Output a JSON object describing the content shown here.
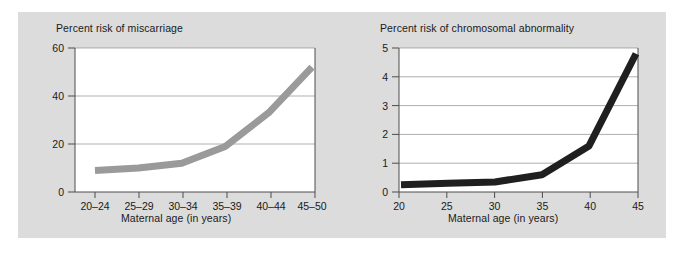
{
  "figure": {
    "background_color": "#dcdcdc",
    "canvas_color": "#ffffff"
  },
  "chart_data": [
    {
      "id": "miscarriage",
      "type": "line",
      "title": "Percent risk of miscarriage",
      "xlabel": "Maternal age (in years)",
      "ylabel": "",
      "categories": [
        "20–24",
        "25–29",
        "30–34",
        "35–39",
        "40–44",
        "45–50"
      ],
      "values": [
        9,
        10,
        12,
        19,
        33,
        52
      ],
      "yticks": [
        0,
        20,
        40,
        60
      ],
      "ylim": [
        0,
        60
      ],
      "grid": "horizontal",
      "legend": "none",
      "series_color": "#9a9a9a",
      "line_width": 7
    },
    {
      "id": "chromosomal",
      "type": "line",
      "title": "Percent risk of chromosomal abnormality",
      "xlabel": "Maternal age (in years)",
      "ylabel": "",
      "categories": [
        "20",
        "25",
        "30",
        "35",
        "40",
        "45"
      ],
      "x": [
        20,
        25,
        30,
        35,
        40,
        45
      ],
      "values": [
        0.25,
        0.3,
        0.35,
        0.6,
        1.6,
        4.8
      ],
      "yticks": [
        0,
        1,
        2,
        3,
        4,
        5
      ],
      "ylim": [
        0,
        5
      ],
      "xlim": [
        20,
        45
      ],
      "grid": "horizontal",
      "legend": "none",
      "series_color": "#1f1f1f",
      "line_width": 7
    }
  ]
}
